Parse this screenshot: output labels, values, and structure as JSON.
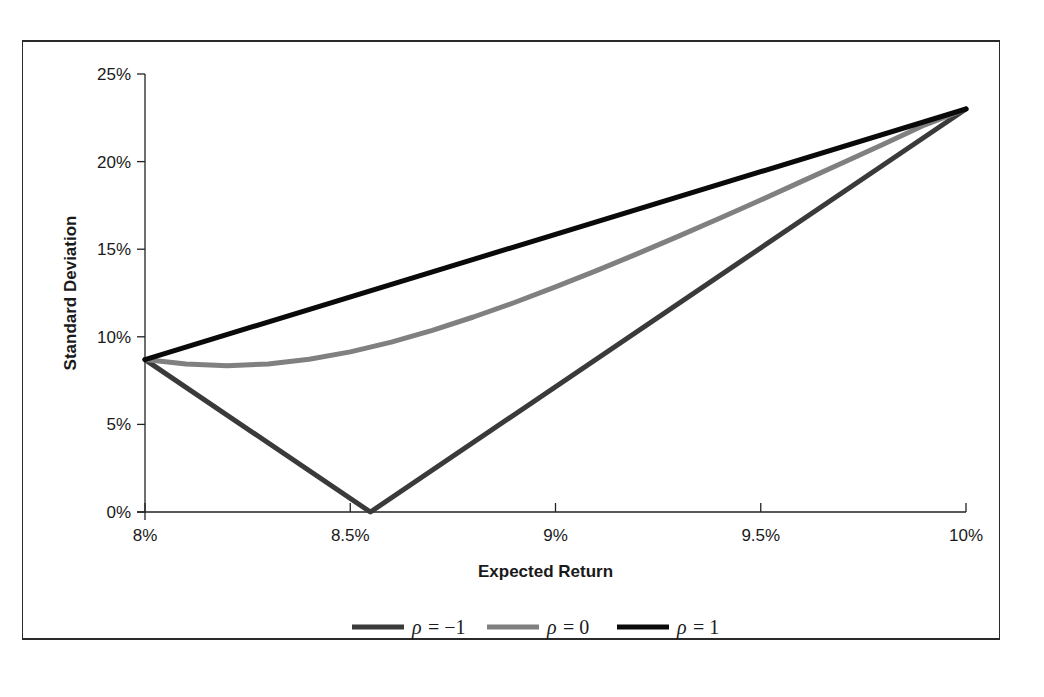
{
  "chart_data": {
    "type": "line",
    "title": "",
    "xlabel": "Expected Return",
    "ylabel": "Standard Deviation",
    "xlim": [
      8,
      10
    ],
    "ylim": [
      0,
      25
    ],
    "x_ticks": [
      8,
      8.5,
      9,
      9.5,
      10
    ],
    "x_tick_labels": [
      "8%",
      "8.5%",
      "9%",
      "9.5%",
      "10%"
    ],
    "y_ticks": [
      0,
      5,
      10,
      15,
      20,
      25
    ],
    "y_tick_labels": [
      "0%",
      "5%",
      "10%",
      "15%",
      "20%",
      "25%"
    ],
    "grid": false,
    "legend_position": "bottom-center",
    "asset_1": {
      "expected_return": 8,
      "std_dev": 8.7
    },
    "asset_2": {
      "expected_return": 10,
      "std_dev": 23
    },
    "series": [
      {
        "name": "ρ = −1",
        "label_symbol": "ρ",
        "label_value": "= −1",
        "rho": -1,
        "color": "#3a3a3a",
        "x": [
          8.0,
          8.549,
          10.0
        ],
        "y": [
          8.7,
          0.0,
          23.0
        ]
      },
      {
        "name": "ρ = 0",
        "label_symbol": "ρ",
        "label_value": "= 0",
        "rho": 0,
        "color": "#808080",
        "x": [
          8.0,
          8.1,
          8.2,
          8.3,
          8.4,
          8.5,
          8.6,
          8.7,
          8.8,
          8.9,
          9.0,
          9.1,
          9.2,
          9.3,
          9.4,
          9.5,
          9.6,
          9.7,
          9.8,
          9.9,
          10.0
        ],
        "y": [
          8.7,
          8.44,
          8.35,
          8.45,
          8.72,
          9.14,
          9.7,
          10.37,
          11.13,
          11.96,
          12.85,
          13.78,
          14.75,
          15.75,
          16.77,
          17.81,
          18.87,
          19.94,
          21.01,
          22.1,
          23.0
        ]
      },
      {
        "name": "ρ = 1",
        "label_symbol": "ρ",
        "label_value": "= 1",
        "rho": 1,
        "color": "#0a0a0a",
        "x": [
          8.0,
          10.0
        ],
        "y": [
          8.7,
          23.0
        ]
      }
    ]
  }
}
